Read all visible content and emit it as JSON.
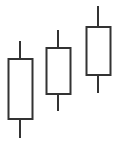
{
  "diagram": {
    "type": "candlestick",
    "colors": {
      "stroke": "#333333",
      "fill": "#ffffff",
      "background": "#ffffff"
    },
    "candles": [
      {
        "name": "candle-1",
        "cx": 20,
        "body_left": 8,
        "body_width": 24,
        "body_top": 59,
        "body_bottom": 119,
        "wick_top": 41,
        "wick_bottom": 138
      },
      {
        "name": "candle-2",
        "cx": 58,
        "body_left": 46,
        "body_width": 24,
        "body_top": 48,
        "body_bottom": 94,
        "wick_top": 30,
        "wick_bottom": 111
      },
      {
        "name": "candle-3",
        "cx": 98,
        "body_left": 86,
        "body_width": 24,
        "body_top": 27,
        "body_bottom": 75,
        "wick_top": 6,
        "wick_bottom": 93
      }
    ]
  }
}
